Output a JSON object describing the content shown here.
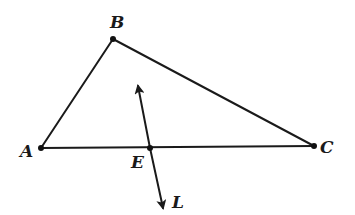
{
  "figure": {
    "points": {
      "A": {
        "label": "A",
        "x": 41,
        "y": 148
      },
      "B": {
        "label": "B",
        "x": 113,
        "y": 39
      },
      "C": {
        "label": "C",
        "x": 314,
        "y": 146
      },
      "E": {
        "label": "E",
        "x": 150,
        "y": 148
      }
    },
    "line": {
      "label": "L",
      "start": {
        "x": 138,
        "y": 88
      },
      "end": {
        "x": 162,
        "y": 205
      },
      "arrows": "both"
    },
    "segments": [
      {
        "from": "A",
        "to": "B"
      },
      {
        "from": "B",
        "to": "C"
      },
      {
        "from": "A",
        "to": "C"
      }
    ],
    "labels": {
      "A": "A",
      "B": "B",
      "C": "C",
      "E": "E",
      "L": "L"
    },
    "colors": {
      "stroke": "#1a1a1a",
      "background": "#ffffff"
    }
  }
}
